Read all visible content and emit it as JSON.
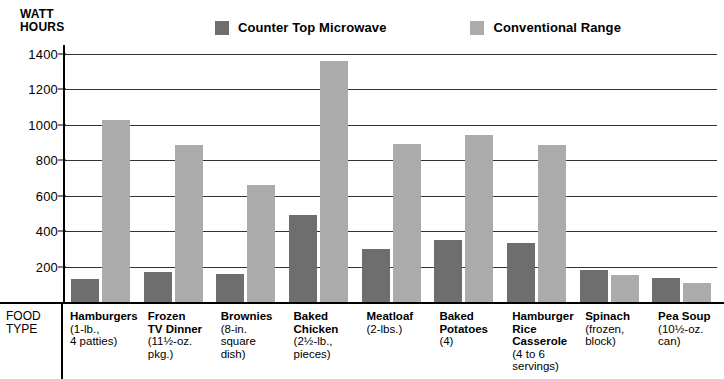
{
  "axis": {
    "y_title_line1": "WATT",
    "y_title_line2": "HOURS",
    "y_ticks": [
      "1400",
      "1200",
      "1000",
      "800",
      "600",
      "400",
      "200"
    ],
    "food_type_line1": "FOOD",
    "food_type_line2": "TYPE"
  },
  "legend": {
    "items": [
      {
        "label": "Counter Top Microwave",
        "color": "#6e6e6e",
        "swatch_name": "legend-swatch-microwave"
      },
      {
        "label": "Conventional Range",
        "color": "#ababab",
        "swatch_name": "legend-swatch-conventional"
      }
    ]
  },
  "categories": [
    {
      "name": "Hamburgers",
      "sub": "(1-lb.,\n4 patties)"
    },
    {
      "name": "Frozen\nTV Dinner",
      "sub": "(11½-oz.\npkg.)"
    },
    {
      "name": "Brownies",
      "sub": "(8-in.\nsquare\ndish)"
    },
    {
      "name": "Baked\nChicken",
      "sub": "(2½-lb.,\npieces)"
    },
    {
      "name": "Meatloaf",
      "sub": "(2-lbs.)"
    },
    {
      "name": "Baked\nPotatoes",
      "sub": "(4)"
    },
    {
      "name": "Hamburger\nRice\nCasserole",
      "sub": "(4 to 6\nservings)"
    },
    {
      "name": "Spinach",
      "sub": "(frozen,\nblock)"
    },
    {
      "name": "Pea Soup",
      "sub": "(10½-oz.\ncan)"
    }
  ],
  "chart_data": {
    "type": "bar",
    "title": "",
    "xlabel": "FOOD TYPE",
    "ylabel": "WATT HOURS",
    "ylim": [
      0,
      1450
    ],
    "grid": true,
    "legend_position": "top",
    "categories": [
      "Hamburgers (1-lb., 4 patties)",
      "Frozen TV Dinner (11½-oz. pkg.)",
      "Brownies (8-in. square dish)",
      "Baked Chicken (2½-lb., pieces)",
      "Meatloaf (2-lbs.)",
      "Baked Potatoes (4)",
      "Hamburger Rice Casserole (4 to 6 servings)",
      "Spinach (frozen, block)",
      "Pea Soup (10½-oz. can)"
    ],
    "series": [
      {
        "name": "Counter Top Microwave",
        "color": "#6e6e6e",
        "values": [
          130,
          170,
          160,
          490,
          300,
          350,
          335,
          180,
          135
        ]
      },
      {
        "name": "Conventional Range",
        "color": "#ababab",
        "values": [
          1025,
          885,
          660,
          1360,
          890,
          945,
          885,
          155,
          110
        ]
      }
    ]
  }
}
